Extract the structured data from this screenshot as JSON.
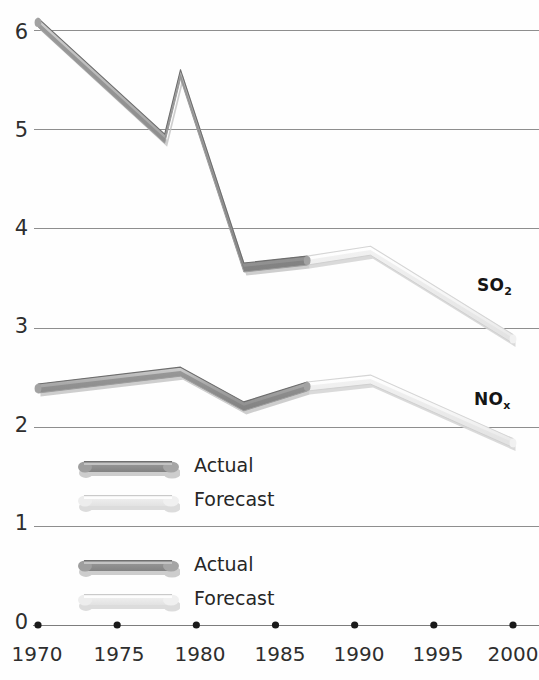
{
  "chart_data": {
    "type": "line",
    "title": "",
    "xlabel": "",
    "ylabel": "",
    "xlim": [
      1970,
      2000
    ],
    "ylim": [
      0,
      6.3
    ],
    "grid": true,
    "y_ticks": [
      "0",
      "1",
      "2",
      "3",
      "4",
      "5",
      "6"
    ],
    "y_tick_values": [
      0,
      1,
      2,
      3,
      4,
      5,
      6
    ],
    "x_ticks": [
      "1970",
      "1975",
      "1980",
      "1985",
      "1990",
      "1995",
      "2000"
    ],
    "x_tick_values": [
      1970,
      1975,
      1980,
      1985,
      1990,
      1995,
      2000
    ],
    "legend_position": "inside-lower-left",
    "series": [
      {
        "name": "SO2",
        "label": "SO",
        "label_sub": "2",
        "actual": {
          "name": "Actual",
          "x": [
            1970,
            1978,
            1979,
            1983,
            1987
          ],
          "y": [
            6.12,
            4.95,
            5.6,
            3.65,
            3.72
          ]
        },
        "forecast": {
          "name": "Forecast",
          "x": [
            1987,
            1991,
            2000
          ],
          "y": [
            3.72,
            3.82,
            2.93
          ]
        }
      },
      {
        "name": "NOx",
        "label": "NO",
        "label_sub": "x",
        "actual": {
          "name": "Actual",
          "x": [
            1970,
            1979,
            1983,
            1987
          ],
          "y": [
            2.43,
            2.6,
            2.25,
            2.45
          ]
        },
        "forecast": {
          "name": "Forecast",
          "x": [
            1987,
            1991,
            2000
          ],
          "y": [
            2.45,
            2.52,
            1.88
          ]
        }
      }
    ]
  },
  "axis": {
    "y_labels": [
      "6",
      "5",
      "4",
      "3",
      "2",
      "1",
      "0"
    ],
    "x_labels": [
      "1970",
      "1975",
      "1980",
      "1985",
      "1990",
      "1995",
      "2000"
    ]
  },
  "series_labels": {
    "so2": {
      "main": "SO",
      "sub": "2"
    },
    "nox": {
      "main": "NO",
      "sub": "x"
    }
  },
  "legend": {
    "group_so2": [
      {
        "label": "Actual",
        "kind": "actual"
      },
      {
        "label": "Forecast",
        "kind": "forecast"
      }
    ],
    "group_nox": [
      {
        "label": "Actual",
        "kind": "actual"
      },
      {
        "label": "Forecast",
        "kind": "forecast"
      }
    ]
  },
  "colors": {
    "actual_top": "#b4b4b4",
    "actual_face": "#8f8f8f",
    "actual_side": "#7a7a7a",
    "forecast_top": "#fbfbfb",
    "forecast_face": "#ededed",
    "forecast_side": "#d8d8d8",
    "shadow": "#cfcfcf",
    "gridline": "#8a8a8a",
    "axis_text": "#2e2e2e",
    "background": "#ffffff"
  }
}
